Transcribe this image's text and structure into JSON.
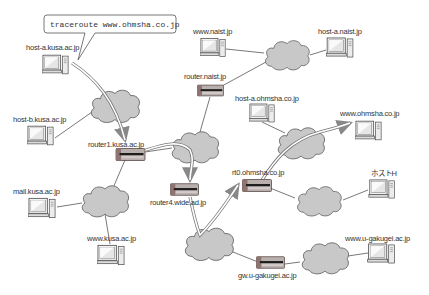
{
  "diagram": {
    "command_bubble": {
      "text": "traceroute www.ohmsha.co.jp"
    },
    "colors": {
      "cloud_fill": "#c8c8c8",
      "cloud_stroke": "#6a6a6a",
      "router_body": "#b9b0ae",
      "router_side": "#8f7472",
      "router_stripe": "#1e1e1e",
      "link_line": "#555555",
      "trace_path": "#888888"
    },
    "hosts": [
      {
        "id": "host-a-kusa",
        "label": "host-a.kusa.ac.jp"
      },
      {
        "id": "host-b-kusa",
        "label": "host-b.kusa.ac.jp"
      },
      {
        "id": "mail-kusa",
        "label": "mail.kusa.ac.jp"
      },
      {
        "id": "www-kusa",
        "label": "www.kusa.ac.jp"
      },
      {
        "id": "www-naist",
        "label": "www.naist.jp"
      },
      {
        "id": "host-a-naist",
        "label": "host-a.naist.jp"
      },
      {
        "id": "host-a-ohmsha",
        "label": "host-a.ohmsha.co.jp"
      },
      {
        "id": "www-ohmsha",
        "label": "www.ohmsha.co.jp"
      },
      {
        "id": "host-h",
        "label": "ホストH"
      },
      {
        "id": "www-u-gakugei",
        "label": "www.u-gakugei.ac.jp"
      }
    ],
    "routers": [
      {
        "id": "router1-kusa",
        "label": "router1.kusa.ac.jp"
      },
      {
        "id": "router-naist",
        "label": "router.naist.jp"
      },
      {
        "id": "router4-wide",
        "label": "router4.wide.ad.jp"
      },
      {
        "id": "rt0-ohmsha",
        "label": "rt0.ohmsha.co.jp"
      },
      {
        "id": "gw-u-gakugei",
        "label": "gw.u-gakugei.ac.jp"
      }
    ],
    "networks": [
      {
        "id": "kusa-lan-1"
      },
      {
        "id": "kusa-lan-2"
      },
      {
        "id": "backbone-center"
      },
      {
        "id": "backbone-lower"
      },
      {
        "id": "naist-lan"
      },
      {
        "id": "ohmsha-lan"
      },
      {
        "id": "host-h-lan"
      },
      {
        "id": "u-gakugei-lan"
      }
    ]
  }
}
